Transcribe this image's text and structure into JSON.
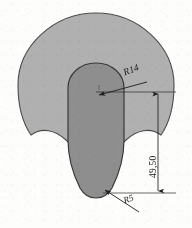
{
  "drawing": {
    "title": "Mushroom profile section drawing",
    "background_color": "#fdfdfc",
    "outer_fill": "#b0b0b0",
    "inner_fill": "#8e8e8e",
    "line_color": "#3a3a3a",
    "dimension_line_color": "#1d1d1d",
    "dimensions": [
      {
        "id": "r14",
        "label": "R14",
        "kind": "radius",
        "value": 14,
        "unit": "mm",
        "rotation_deg": -21
      },
      {
        "id": "r5",
        "label": "R5",
        "kind": "radius",
        "value": 5,
        "unit": "mm",
        "rotation_deg": -20
      },
      {
        "id": "length_4950",
        "label": "49,50",
        "kind": "linear",
        "value": 49.5,
        "unit": "mm",
        "rotation_deg": -90
      }
    ]
  }
}
